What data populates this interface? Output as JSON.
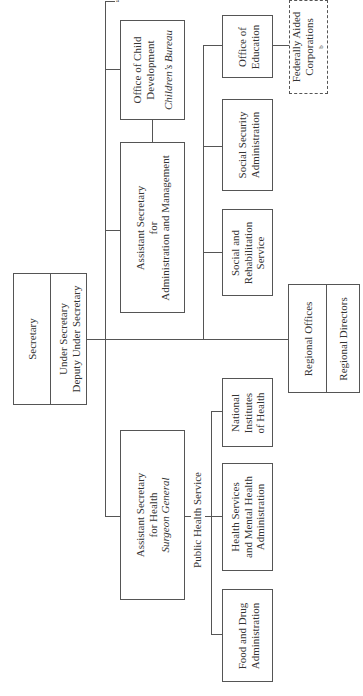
{
  "secretary": {
    "title": "Secretary",
    "line1": "Under Secretary",
    "line2": "Deputy Under Secretary"
  },
  "regional": {
    "offices": "Regional Offices",
    "directors": "Regional Directors"
  },
  "admin_management": {
    "line1": "Assistant Secretary",
    "line2": "for",
    "line3": "Administration and Management"
  },
  "child_development": {
    "line1": "Office of Child",
    "line2": "Development",
    "line3": "Children’s Bureau"
  },
  "health": {
    "line1": "Assistant Secretary",
    "line2": "for Health",
    "line3": "Surgeon General"
  },
  "public_health_service_label": "Public Health Service",
  "nih": {
    "line1": "National",
    "line2": "Institutes",
    "line3": "of Health"
  },
  "hsmha": {
    "line1": "Health Services",
    "line2": "and Mental Health",
    "line3": "Administration"
  },
  "fda": {
    "line1": "Food and Drug",
    "line2": "Administration"
  },
  "srs": {
    "line1": "Social and",
    "line2": "Rehabilitation",
    "line3": "Service"
  },
  "ssa": {
    "line1": "Social Security",
    "line2": "Administration"
  },
  "education": {
    "line1": "Office of",
    "line2": "Education"
  },
  "federally_aided": {
    "line1": "Federally Aided",
    "line2": "Corporations",
    "footnote": "b"
  },
  "footnote_a": "a"
}
